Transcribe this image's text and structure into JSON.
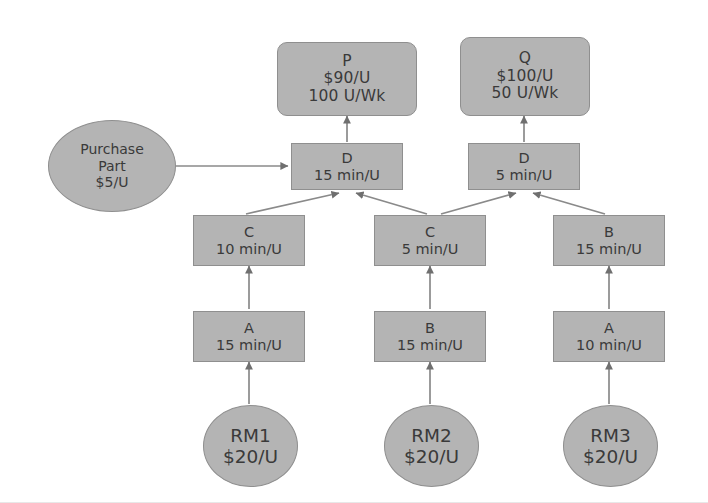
{
  "diagram": {
    "background_color": "#ffffff",
    "node_fill_color": "#b4b4b4",
    "node_border_color": "#8f8f8f",
    "edge_color": "#7a7a7a",
    "text_color": "#3a3a3a"
  },
  "nodes": {
    "product_p": {
      "name": "P",
      "price": "$90/U",
      "demand": "100 U/Wk"
    },
    "product_q": {
      "name": "Q",
      "price": "$100/U",
      "demand": "50 U/Wk"
    },
    "purchase_part": {
      "line1": "Purchase",
      "line2": "Part",
      "line3": "$5/U"
    },
    "d_left": {
      "name": "D",
      "time": "15 min/U"
    },
    "d_right": {
      "name": "D",
      "time": "5 min/U"
    },
    "c_left": {
      "name": "C",
      "time": "10 min/U"
    },
    "c_mid": {
      "name": "C",
      "time": "5 min/U"
    },
    "b_right": {
      "name": "B",
      "time": "15 min/U"
    },
    "a_left": {
      "name": "A",
      "time": "15 min/U"
    },
    "b_mid": {
      "name": "B",
      "time": "15 min/U"
    },
    "a_right": {
      "name": "A",
      "time": "10 min/U"
    },
    "rm1": {
      "name": "RM1",
      "price": "$20/U"
    },
    "rm2": {
      "name": "RM2",
      "price": "$20/U"
    },
    "rm3": {
      "name": "RM3",
      "price": "$20/U"
    }
  },
  "edges": [
    {
      "from": "d_left",
      "to": "product_p",
      "kind": "vertical-arrow"
    },
    {
      "from": "d_right",
      "to": "product_q",
      "kind": "vertical-arrow"
    },
    {
      "from": "purchase_part",
      "to": "d_left",
      "kind": "horizontal-arrow"
    },
    {
      "from": "c_left",
      "to": "d_left",
      "kind": "diagonal-arrow"
    },
    {
      "from": "c_mid",
      "to": "d_left",
      "kind": "diagonal-arrow"
    },
    {
      "from": "c_mid",
      "to": "d_right",
      "kind": "diagonal-arrow"
    },
    {
      "from": "b_right",
      "to": "d_right",
      "kind": "diagonal-arrow"
    },
    {
      "from": "a_left",
      "to": "c_left",
      "kind": "vertical-arrow"
    },
    {
      "from": "b_mid",
      "to": "c_mid",
      "kind": "vertical-arrow"
    },
    {
      "from": "a_right",
      "to": "b_right",
      "kind": "vertical-arrow"
    },
    {
      "from": "rm1",
      "to": "a_left",
      "kind": "vertical-arrow"
    },
    {
      "from": "rm2",
      "to": "b_mid",
      "kind": "vertical-arrow"
    },
    {
      "from": "rm3",
      "to": "a_right",
      "kind": "vertical-arrow"
    }
  ]
}
